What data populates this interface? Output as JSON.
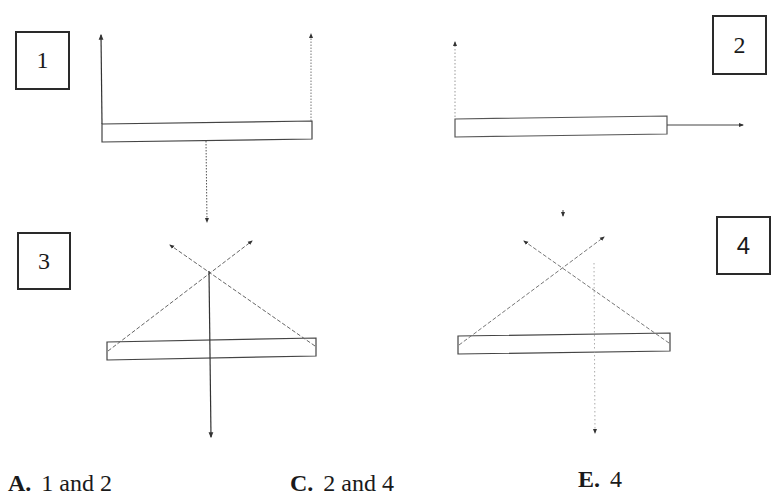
{
  "panels": [
    {
      "id": "1",
      "label": "1"
    },
    {
      "id": "2",
      "label": "2"
    },
    {
      "id": "3",
      "label": "3"
    },
    {
      "id": "4",
      "label": "4"
    }
  ],
  "answers": [
    {
      "letter": "A.",
      "text": "1 and 2"
    },
    {
      "letter": "C.",
      "text": "2 and 4"
    },
    {
      "letter": "E.",
      "text": "4"
    }
  ],
  "colors": {
    "line": "#333333",
    "dashed": "#666666",
    "dotted": "#777777",
    "box_border": "#2a2a2a"
  }
}
